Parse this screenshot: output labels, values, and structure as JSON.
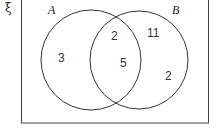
{
  "diagram": {
    "type": "venn",
    "universal_symbol": "ξ",
    "sets": [
      {
        "name": "A",
        "only": "3"
      },
      {
        "name": "B",
        "only": "11"
      }
    ],
    "regions": {
      "a_only": "3",
      "intersection_top": "2",
      "intersection_bottom": "5",
      "b_only_top": "11",
      "b_only_bottom": "2"
    },
    "colors": {
      "stroke": "#333333",
      "background": "#ffffff"
    }
  }
}
